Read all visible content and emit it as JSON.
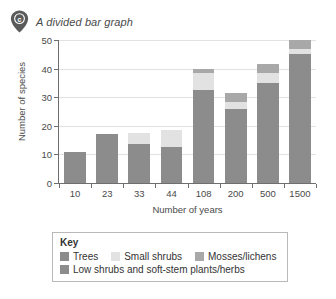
{
  "header": {
    "badge_letter": "c",
    "badge_icon": "map-pin-icon",
    "title": "A divided bar graph"
  },
  "colors": {
    "trees": "#8c8c8c",
    "small_shrubs": "#e2e2e2",
    "mosses_lichens": "#a8a8a8",
    "low_shrubs": "#8c8c8c",
    "axis": "#6e6e6e",
    "grid": "#e2e2e2",
    "badge": "#5a5a5a"
  },
  "legend": {
    "title": "Key",
    "items": [
      {
        "label": "Trees",
        "color_key": "trees"
      },
      {
        "label": "Small shrubs",
        "color_key": "small_shrubs"
      },
      {
        "label": "Mosses/lichens",
        "color_key": "mosses_lichens"
      },
      {
        "label": "Low shrubs and soft-stem plants/herbs",
        "color_key": "low_shrubs"
      }
    ]
  },
  "chart_data": {
    "type": "bar",
    "subtype": "stacked",
    "title": "A divided bar graph",
    "xlabel": "Number of years",
    "ylabel": "Number of species",
    "categories": [
      "10",
      "23",
      "33",
      "44",
      "108",
      "200",
      "500",
      "1500"
    ],
    "ylim": [
      0,
      50
    ],
    "yticks": [
      0,
      10,
      20,
      30,
      40,
      50
    ],
    "grid": true,
    "legend_position": "below-axes",
    "series": [
      {
        "name": "Low shrubs and soft-stem plants/herbs",
        "color": "#8c8c8c",
        "values": [
          11,
          17,
          13.5,
          12.5,
          32.5,
          26,
          35,
          45
        ]
      },
      {
        "name": "Small shrubs",
        "color": "#e2e2e2",
        "values": [
          0,
          0,
          4,
          6,
          6,
          2.5,
          3.5,
          2
        ]
      },
      {
        "name": "Mosses/lichens",
        "color": "#a8a8a8",
        "values": [
          0,
          0,
          0,
          0,
          1.5,
          3,
          3,
          3
        ]
      }
    ],
    "totals": [
      11,
      17,
      17.5,
      18.5,
      40,
      31.5,
      41.5,
      50
    ]
  }
}
